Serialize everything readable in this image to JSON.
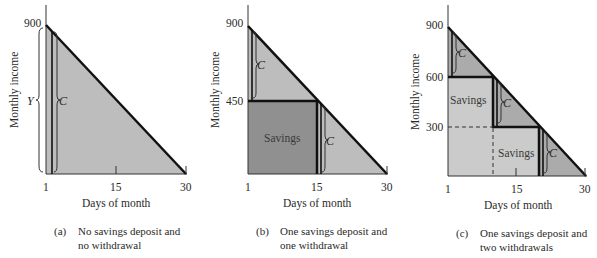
{
  "panels": [
    {
      "id": "a",
      "caption_label": "(a)",
      "caption_line1": "No savings deposit and",
      "caption_line2": "no withdrawal",
      "y_axis_label": "Monthly income",
      "x_axis_label": "Days of month",
      "y_ticks": [
        "900"
      ],
      "x_ticks": [
        "1",
        "15",
        "30"
      ],
      "brace_labels": [
        "Y",
        "C"
      ]
    },
    {
      "id": "b",
      "caption_label": "(b)",
      "caption_line1": "One savings deposit and",
      "caption_line2": "one withdrawal",
      "y_axis_label": "Monthly income",
      "x_axis_label": "Days of month",
      "y_ticks": [
        "900",
        "450"
      ],
      "x_ticks": [
        "1",
        "15",
        "30"
      ],
      "brace_labels": [
        "C",
        "C"
      ],
      "region_labels": [
        "Savings"
      ]
    },
    {
      "id": "c",
      "caption_label": "(c)",
      "caption_line1": "One savings deposit and",
      "caption_line2": "two withdrawals",
      "y_axis_label": "Monthly income",
      "x_axis_label": "Days of month",
      "y_ticks": [
        "900",
        "600",
        "300"
      ],
      "x_ticks": [
        "1",
        "15",
        "30"
      ],
      "brace_labels": [
        "C",
        "C",
        "C"
      ],
      "region_labels": [
        "Savings",
        "Savings"
      ]
    }
  ],
  "colors": {
    "triangle_light": "#bdbdbd",
    "savings_dark": "#909090",
    "savings_light": "#cbcbcb",
    "consumption_c": "#ababab",
    "line": "#111111"
  }
}
